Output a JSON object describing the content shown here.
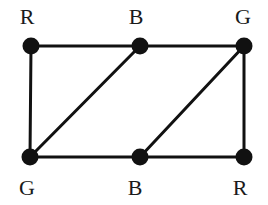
{
  "figure": {
    "type": "graph-coloring-diagram",
    "background_color": "#ffffff",
    "stroke_color": "#111111",
    "node_fill_color": "#111111",
    "label_color": "#1a1a1a",
    "width": 268,
    "height": 205,
    "edge_width": 3,
    "node_radius": 8.5
  },
  "nodes": [
    {
      "id": "n1",
      "label": "R",
      "x": 31,
      "y": 46,
      "label_x": 27,
      "label_y": 17,
      "label_position": "above"
    },
    {
      "id": "n2",
      "label": "B",
      "x": 140,
      "y": 46,
      "label_x": 136,
      "label_y": 17,
      "label_position": "above"
    },
    {
      "id": "n3",
      "label": "G",
      "x": 244,
      "y": 46,
      "label_x": 243,
      "label_y": 17,
      "label_position": "above"
    },
    {
      "id": "n4",
      "label": "G",
      "x": 30,
      "y": 157,
      "label_x": 27,
      "label_y": 188,
      "label_position": "below"
    },
    {
      "id": "n5",
      "label": "B",
      "x": 140,
      "y": 157,
      "label_x": 135,
      "label_y": 188,
      "label_position": "below"
    },
    {
      "id": "n6",
      "label": "R",
      "x": 244,
      "y": 157,
      "label_x": 240,
      "label_y": 188,
      "label_position": "below"
    }
  ],
  "edges": [
    {
      "id": "e1",
      "name": "edge-top-left-to-top-middle",
      "from": "n1",
      "to": "n2",
      "kind": "horizontal"
    },
    {
      "id": "e2",
      "name": "edge-top-middle-to-top-right",
      "from": "n2",
      "to": "n3",
      "kind": "horizontal"
    },
    {
      "id": "e3",
      "name": "edge-bottom-left-to-bottom-middle",
      "from": "n4",
      "to": "n5",
      "kind": "horizontal"
    },
    {
      "id": "e4",
      "name": "edge-bottom-middle-to-bottom-right",
      "from": "n5",
      "to": "n6",
      "kind": "horizontal"
    },
    {
      "id": "e5",
      "name": "edge-left-vertical",
      "from": "n1",
      "to": "n4",
      "kind": "vertical"
    },
    {
      "id": "e6",
      "name": "edge-right-vertical",
      "from": "n3",
      "to": "n6",
      "kind": "vertical"
    },
    {
      "id": "e7",
      "name": "edge-diagonal-bottom-left-to-top-middle",
      "from": "n4",
      "to": "n2",
      "kind": "diagonal"
    },
    {
      "id": "e8",
      "name": "edge-diagonal-bottom-middle-to-top-right",
      "from": "n5",
      "to": "n3",
      "kind": "diagonal"
    }
  ]
}
